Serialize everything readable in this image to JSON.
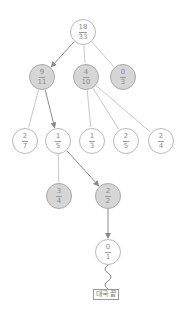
{
  "diagram": {
    "type": "game-tree",
    "colors": {
      "edge": "#c8c8c8",
      "edge_path": "#8a8a8a",
      "visited_fill": "#d6d6d6",
      "node_fill": "#ffffff",
      "text": "#8a8a8a"
    },
    "nodes": [
      {
        "id": "root",
        "num": "18",
        "den": "33",
        "x": 83,
        "y": 32,
        "visited": false
      },
      {
        "id": "n9_11",
        "num": "9",
        "den": "11",
        "x": 42,
        "y": 77,
        "visited": true
      },
      {
        "id": "n4_10",
        "num": "4",
        "den": "10",
        "x": 86,
        "y": 77,
        "visited": true
      },
      {
        "id": "n0_3",
        "num": "0",
        "den": "3",
        "x": 123,
        "y": 77,
        "visited": true
      },
      {
        "id": "n2_7",
        "num": "2",
        "den": "7",
        "x": 25,
        "y": 141,
        "visited": false
      },
      {
        "id": "n1_5",
        "num": "1",
        "den": "5",
        "x": 58,
        "y": 141,
        "visited": false
      },
      {
        "id": "n1_3",
        "num": "1",
        "den": "3",
        "x": 92,
        "y": 141,
        "visited": false
      },
      {
        "id": "n2_5",
        "num": "2",
        "den": "5",
        "x": 126,
        "y": 141,
        "visited": false
      },
      {
        "id": "n2_4",
        "num": "2",
        "den": "4",
        "x": 161,
        "y": 141,
        "visited": false
      },
      {
        "id": "n3_4",
        "num": "3",
        "den": "4",
        "x": 59,
        "y": 196,
        "visited": true
      },
      {
        "id": "n2_2",
        "num": "2",
        "den": "2",
        "x": 108,
        "y": 196,
        "visited": true
      },
      {
        "id": "n0_1",
        "num": "0",
        "den": "1",
        "x": 108,
        "y": 252,
        "visited": false
      }
    ],
    "edges": [
      {
        "from": "root",
        "to": "n9_11",
        "path": true
      },
      {
        "from": "root",
        "to": "n4_10",
        "path": false
      },
      {
        "from": "root",
        "to": "n0_3",
        "path": false
      },
      {
        "from": "n9_11",
        "to": "n2_7",
        "path": false
      },
      {
        "from": "n9_11",
        "to": "n1_5",
        "path": true
      },
      {
        "from": "n4_10",
        "to": "n1_3",
        "path": false
      },
      {
        "from": "n4_10",
        "to": "n2_5",
        "path": false
      },
      {
        "from": "n4_10",
        "to": "n2_4",
        "path": false
      },
      {
        "from": "n1_5",
        "to": "n3_4",
        "path": false
      },
      {
        "from": "n1_5",
        "to": "n2_2",
        "path": true
      },
      {
        "from": "n2_2",
        "to": "n0_1",
        "path": true
      }
    ],
    "end_box": {
      "label": "대국 끝",
      "x": 108,
      "y": 295
    }
  }
}
